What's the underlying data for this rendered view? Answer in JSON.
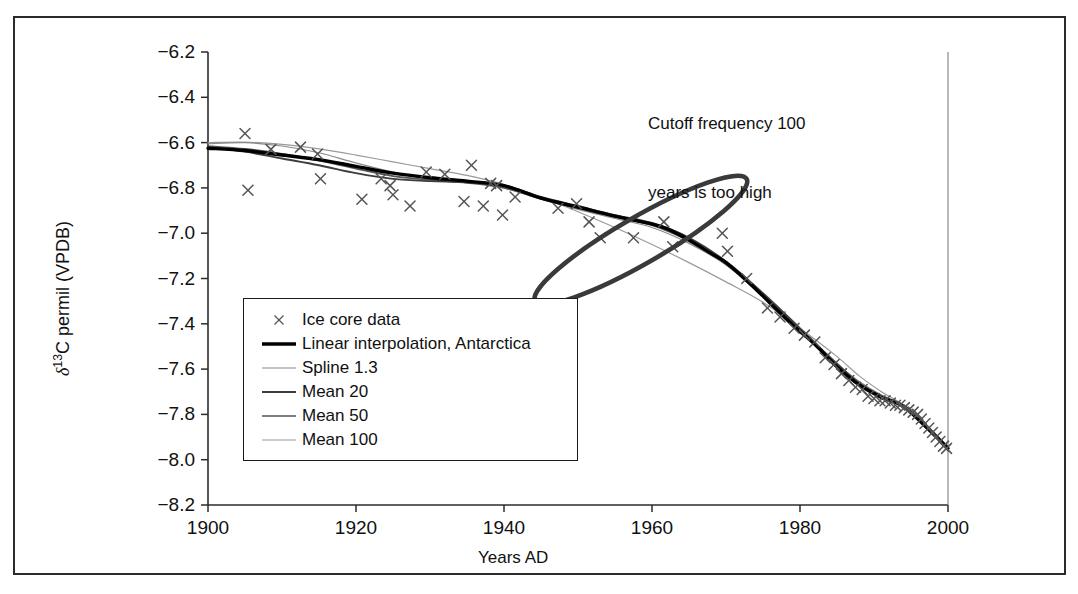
{
  "figure": {
    "border_color": "#2b2b2b",
    "background": "#ffffff"
  },
  "annotation": {
    "line1": "Cutoff frequency 100",
    "line2": "years is too high",
    "ellipse_color": "#3a3a3a"
  },
  "legend": {
    "items": [
      {
        "label": "Ice core data",
        "key": "marker-x",
        "color": "#555555",
        "width": 1.2
      },
      {
        "label": "Linear interpolation, Antarctica",
        "key": "line",
        "color": "#000000",
        "width": 3.4
      },
      {
        "label": "Spline 1.3",
        "key": "line",
        "color": "#8a8a8a",
        "width": 1.2
      },
      {
        "label": "Mean 20",
        "key": "line",
        "color": "#3d3d3d",
        "width": 1.9
      },
      {
        "label": "Mean 50",
        "key": "line",
        "color": "#555555",
        "width": 1.7
      },
      {
        "label": "Mean 100",
        "key": "line",
        "color": "#9a9a9a",
        "width": 1.2
      }
    ]
  },
  "chart_data": {
    "type": "scatter",
    "title": "",
    "xlabel": "Years AD",
    "ylabel": "δ13C permil (VPDB)",
    "ylabel_parts": {
      "delta": "δ",
      "sup": "13",
      "rest": "C permil (VPDB)"
    },
    "xlim": [
      1900,
      2000
    ],
    "ylim": [
      -8.2,
      -6.2
    ],
    "xticks": [
      1900,
      1920,
      1940,
      1960,
      1980,
      2000
    ],
    "yticks": [
      "-6.2",
      "-6.4",
      "-6.6",
      "-6.8",
      "-7.0",
      "-7.2",
      "-7.4",
      "-7.6",
      "-7.8",
      "-8.0",
      "-8.2"
    ],
    "grid": false,
    "legend_position": "inside-lower-left",
    "annotations": [
      {
        "text": "Cutoff frequency 100 years is too high",
        "type": "text",
        "x": 1962,
        "y": -6.28
      },
      {
        "type": "ellipse",
        "cx": 1958.5,
        "cy": -7.03,
        "rx": 16.5,
        "ry": 10.2,
        "rotation_deg": -30,
        "note": "hand-drawn circle highlighting 1947-1975 region"
      }
    ],
    "series": [
      {
        "name": "Ice core data",
        "type": "scatter",
        "marker": "x",
        "color": "#555555",
        "points": [
          [
            1905.0,
            -6.56
          ],
          [
            1905.4,
            -6.81
          ],
          [
            1908.5,
            -6.63
          ],
          [
            1912.5,
            -6.62
          ],
          [
            1914.8,
            -6.65
          ],
          [
            1915.2,
            -6.76
          ],
          [
            1920.8,
            -6.85
          ],
          [
            1923.4,
            -6.76
          ],
          [
            1924.6,
            -6.79
          ],
          [
            1925.0,
            -6.83
          ],
          [
            1927.3,
            -6.88
          ],
          [
            1929.5,
            -6.73
          ],
          [
            1932.0,
            -6.74
          ],
          [
            1934.6,
            -6.86
          ],
          [
            1935.6,
            -6.7
          ],
          [
            1937.2,
            -6.88
          ],
          [
            1938.2,
            -6.78
          ],
          [
            1939.0,
            -6.79
          ],
          [
            1939.8,
            -6.92
          ],
          [
            1941.5,
            -6.84
          ],
          [
            1947.3,
            -6.89
          ],
          [
            1949.8,
            -6.87
          ],
          [
            1951.5,
            -6.95
          ],
          [
            1953.0,
            -7.02
          ],
          [
            1957.5,
            -7.02
          ],
          [
            1961.6,
            -6.95
          ],
          [
            1962.8,
            -7.06
          ],
          [
            1969.5,
            -7.0
          ],
          [
            1970.2,
            -7.08
          ],
          [
            1972.8,
            -7.2
          ],
          [
            1975.6,
            -7.33
          ],
          [
            1977.3,
            -7.37
          ],
          [
            1979.2,
            -7.42
          ],
          [
            1980.6,
            -7.45
          ],
          [
            1982.0,
            -7.48
          ],
          [
            1983.4,
            -7.55
          ],
          [
            1984.6,
            -7.58
          ],
          [
            1985.6,
            -7.62
          ],
          [
            1986.6,
            -7.65
          ],
          [
            1987.5,
            -7.68
          ],
          [
            1988.4,
            -7.69
          ],
          [
            1989.2,
            -7.72
          ],
          [
            1990.0,
            -7.73
          ],
          [
            1990.8,
            -7.74
          ],
          [
            1991.5,
            -7.74
          ],
          [
            1992.2,
            -7.75
          ],
          [
            1992.9,
            -7.76
          ],
          [
            1993.5,
            -7.76
          ],
          [
            1994.1,
            -7.77
          ],
          [
            1994.7,
            -7.78
          ],
          [
            1995.3,
            -7.79
          ],
          [
            1995.9,
            -7.8
          ],
          [
            1996.4,
            -7.82
          ],
          [
            1996.9,
            -7.84
          ],
          [
            1997.4,
            -7.86
          ],
          [
            1997.9,
            -7.88
          ],
          [
            1998.4,
            -7.9
          ],
          [
            1998.9,
            -7.92
          ],
          [
            1999.4,
            -7.94
          ],
          [
            1999.8,
            -7.95
          ]
        ]
      },
      {
        "name": "Linear interpolation, Antarctica",
        "type": "line",
        "color": "#000000",
        "width": 3.4,
        "points": [
          [
            1900,
            -6.625
          ],
          [
            1905,
            -6.635
          ],
          [
            1910,
            -6.655
          ],
          [
            1915,
            -6.675
          ],
          [
            1920,
            -6.705
          ],
          [
            1925,
            -6.735
          ],
          [
            1930,
            -6.755
          ],
          [
            1935,
            -6.77
          ],
          [
            1940,
            -6.79
          ],
          [
            1945,
            -6.845
          ],
          [
            1950,
            -6.885
          ],
          [
            1955,
            -6.925
          ],
          [
            1960,
            -6.96
          ],
          [
            1962,
            -6.98
          ],
          [
            1965,
            -7.03
          ],
          [
            1968,
            -7.09
          ],
          [
            1970,
            -7.13
          ],
          [
            1973,
            -7.215
          ],
          [
            1976,
            -7.31
          ],
          [
            1979,
            -7.405
          ],
          [
            1982,
            -7.49
          ],
          [
            1985,
            -7.59
          ],
          [
            1988,
            -7.67
          ],
          [
            1991,
            -7.725
          ],
          [
            1994,
            -7.765
          ],
          [
            1997,
            -7.855
          ],
          [
            2000,
            -7.95
          ]
        ]
      },
      {
        "name": "Spline 1.3",
        "type": "line",
        "color": "#8a8a8a",
        "width": 1.2,
        "points": [
          [
            1900,
            -6.605
          ],
          [
            1905,
            -6.6
          ],
          [
            1910,
            -6.615
          ],
          [
            1915,
            -6.645
          ],
          [
            1920,
            -6.69
          ],
          [
            1925,
            -6.73
          ],
          [
            1930,
            -6.76
          ],
          [
            1935,
            -6.775
          ],
          [
            1940,
            -6.8
          ],
          [
            1945,
            -6.85
          ],
          [
            1950,
            -6.895
          ],
          [
            1955,
            -6.935
          ],
          [
            1960,
            -6.975
          ],
          [
            1965,
            -7.045
          ],
          [
            1970,
            -7.14
          ],
          [
            1975,
            -7.28
          ],
          [
            1980,
            -7.43
          ],
          [
            1985,
            -7.58
          ],
          [
            1988,
            -7.655
          ],
          [
            1991,
            -7.715
          ],
          [
            1994,
            -7.76
          ],
          [
            1997,
            -7.85
          ],
          [
            2000,
            -7.955
          ]
        ]
      },
      {
        "name": "Mean 20",
        "type": "line",
        "color": "#3d3d3d",
        "width": 1.9,
        "points": [
          [
            1900,
            -6.62
          ],
          [
            1905,
            -6.64
          ],
          [
            1910,
            -6.67
          ],
          [
            1915,
            -6.7
          ],
          [
            1920,
            -6.735
          ],
          [
            1925,
            -6.76
          ],
          [
            1930,
            -6.77
          ],
          [
            1935,
            -6.775
          ],
          [
            1940,
            -6.79
          ],
          [
            1945,
            -6.84
          ],
          [
            1950,
            -6.88
          ],
          [
            1955,
            -6.92
          ],
          [
            1960,
            -6.955
          ],
          [
            1965,
            -7.02
          ],
          [
            1970,
            -7.125
          ],
          [
            1975,
            -7.265
          ],
          [
            1980,
            -7.42
          ],
          [
            1985,
            -7.58
          ],
          [
            1988,
            -7.665
          ],
          [
            1991,
            -7.72
          ],
          [
            1994,
            -7.76
          ],
          [
            1997,
            -7.845
          ],
          [
            2000,
            -7.945
          ]
        ]
      },
      {
        "name": "Mean 50",
        "type": "line",
        "color": "#555555",
        "width": 1.7,
        "points": [
          [
            1900,
            -6.615
          ],
          [
            1905,
            -6.628
          ],
          [
            1910,
            -6.65
          ],
          [
            1915,
            -6.68
          ],
          [
            1920,
            -6.715
          ],
          [
            1925,
            -6.748
          ],
          [
            1930,
            -6.765
          ],
          [
            1935,
            -6.778
          ],
          [
            1940,
            -6.8
          ],
          [
            1945,
            -6.848
          ],
          [
            1950,
            -6.89
          ],
          [
            1955,
            -6.928
          ],
          [
            1960,
            -6.965
          ],
          [
            1965,
            -7.035
          ],
          [
            1970,
            -7.135
          ],
          [
            1975,
            -7.275
          ],
          [
            1980,
            -7.425
          ],
          [
            1985,
            -7.575
          ],
          [
            1988,
            -7.66
          ],
          [
            1991,
            -7.718
          ],
          [
            1994,
            -7.762
          ],
          [
            1997,
            -7.85
          ],
          [
            2000,
            -7.95
          ]
        ]
      },
      {
        "name": "Mean 100",
        "type": "line",
        "color": "#9a9a9a",
        "width": 1.2,
        "points": [
          [
            1900,
            -6.6
          ],
          [
            1905,
            -6.598
          ],
          [
            1910,
            -6.608
          ],
          [
            1915,
            -6.628
          ],
          [
            1920,
            -6.655
          ],
          [
            1925,
            -6.685
          ],
          [
            1930,
            -6.715
          ],
          [
            1935,
            -6.745
          ],
          [
            1940,
            -6.785
          ],
          [
            1945,
            -6.84
          ],
          [
            1950,
            -6.905
          ],
          [
            1955,
            -6.975
          ],
          [
            1960,
            -7.05
          ],
          [
            1965,
            -7.13
          ],
          [
            1970,
            -7.215
          ],
          [
            1975,
            -7.305
          ],
          [
            1980,
            -7.42
          ],
          [
            1985,
            -7.545
          ],
          [
            1988,
            -7.63
          ],
          [
            1991,
            -7.7
          ],
          [
            1994,
            -7.76
          ],
          [
            1997,
            -7.855
          ],
          [
            2000,
            -7.96
          ]
        ]
      }
    ]
  }
}
